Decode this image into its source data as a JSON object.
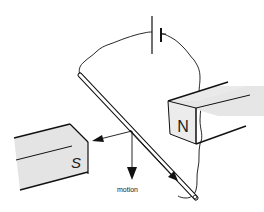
{
  "diagram": {
    "type": "physics-electromagnetism",
    "labels": {
      "south_pole": "S",
      "north_pole": "N",
      "motion": "motion"
    },
    "components": {
      "battery": "battery-cell",
      "rod": "conducting-rod",
      "wire": "circuit-wire",
      "magnet_south": "bar-magnet-south",
      "magnet_north": "bar-magnet-north",
      "force_arrow": "force-arrow-left",
      "motion_arrow": "motion-arrow-down",
      "current_arrow": "current-arrow-along-rod"
    },
    "colors": {
      "stroke": "#111111",
      "magnet_fill": "#e2e2e2",
      "magnet_face": "#ececec",
      "background": "#ffffff"
    }
  }
}
